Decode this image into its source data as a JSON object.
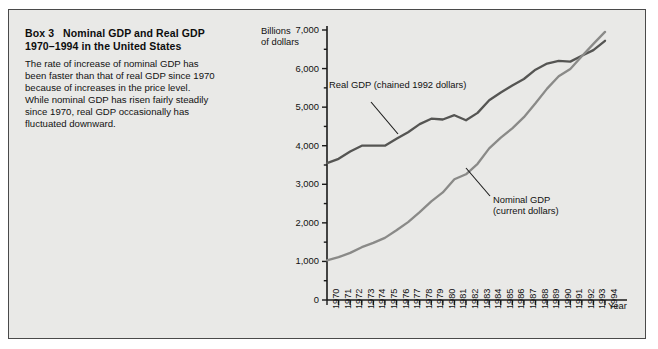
{
  "box": {
    "label": "Box 3",
    "title_line1": "Nominal GDP and Real GDP",
    "title_line2": "1970–1994 in the United States",
    "body_lines": [
      "The rate of increase of nominal GDP has",
      "been faster than that of real GDP since 1970",
      "because of increases in the price level.",
      "While nominal GDP has risen fairly steadily",
      "since 1970, real GDP occasionally has",
      "fluctuated downward."
    ]
  },
  "colors": {
    "page": "#ffffff",
    "panel": "#e9e9e7",
    "border": "#4a4a4a",
    "axis": "#1a1a1a",
    "real_line": "#555553",
    "nominal_line": "#8a8a88",
    "text": "#111111"
  },
  "chart_data": {
    "type": "line",
    "title": "Nominal GDP and Real GDP 1970–1994 in the United States",
    "xlabel": "Year",
    "ylabel": "Billions of dollars",
    "ylabel_line1": "Billions",
    "ylabel_line2": "of dollars",
    "ylim": [
      0,
      7000
    ],
    "ytick_step": 1000,
    "yminor_step": 500,
    "grid": false,
    "legend": "annotations",
    "categories": [
      "1970",
      "1971",
      "1972",
      "1973",
      "1974",
      "1975",
      "1976",
      "1977",
      "1978",
      "1979",
      "1980",
      "1981",
      "1982",
      "1983",
      "1984",
      "1985",
      "1986",
      "1987",
      "1988",
      "1989",
      "1990",
      "1991",
      "1992",
      "1993",
      "1994"
    ],
    "ytick_labels": [
      "0",
      "1,000",
      "2,000",
      "3,000",
      "4,000",
      "5,000",
      "6,000",
      "7,000"
    ],
    "ytick_values": [
      0,
      1000,
      2000,
      3000,
      4000,
      5000,
      6000,
      7000
    ],
    "series": [
      {
        "name": "Real GDP (chained 1992 dollars)",
        "label_line1": "Real GDP (chained 1992 dollars)",
        "color": "#555553",
        "values": [
          3550,
          3660,
          3850,
          4000,
          4000,
          4000,
          4180,
          4350,
          4560,
          4700,
          4680,
          4790,
          4660,
          4850,
          5180,
          5380,
          5560,
          5730,
          5970,
          6130,
          6200,
          6180,
          6330,
          6480,
          6720
        ]
      },
      {
        "name": "Nominal GDP (current dollars)",
        "label_line1": "Nominal GDP",
        "label_line2": "(current dollars)",
        "color": "#8a8a88",
        "values": [
          1030,
          1110,
          1220,
          1370,
          1480,
          1610,
          1810,
          2020,
          2280,
          2560,
          2790,
          3130,
          3260,
          3530,
          3930,
          4210,
          4450,
          4740,
          5100,
          5480,
          5800,
          5990,
          6320,
          6640,
          6950
        ]
      }
    ],
    "annotations": [
      {
        "text": "Real GDP (chained 1992 dollars)",
        "target_year": "1978"
      },
      {
        "text": "Nominal GDP (current dollars)",
        "target_year": "1985"
      }
    ]
  }
}
